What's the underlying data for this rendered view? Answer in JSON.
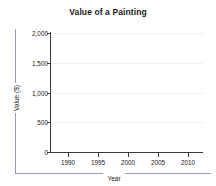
{
  "chart_data": {
    "type": "line",
    "title": "Value of a Painting",
    "xlabel": "Year",
    "ylabel": "Value ($)",
    "xlim": [
      1987,
      2012.5
    ],
    "ylim": [
      0,
      2000
    ],
    "x_ticks": [
      1990,
      1995,
      2000,
      2005,
      2010
    ],
    "x_tick_labels": [
      "1990",
      "1995",
      "2000",
      "2005",
      "2010"
    ],
    "y_ticks": [
      0,
      500,
      1000,
      1500,
      2000
    ],
    "y_tick_labels": [
      "0",
      "500",
      "1,000",
      "1,500",
      "2,000"
    ],
    "grid": "horizontal",
    "legend": "none",
    "series": [
      {
        "name": "Value of a Painting",
        "x": [],
        "values": []
      }
    ],
    "colors": {
      "axis": "#3a3a3a",
      "gridline": "#f0f0f2",
      "axis_rail": "#9a9ab4",
      "text": "#1a1a1a",
      "background": "#ffffff"
    }
  }
}
